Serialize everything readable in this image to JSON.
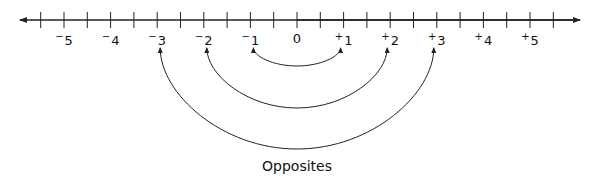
{
  "diagram": {
    "type": "number-line",
    "caption": "Opposites",
    "line": {
      "y": 20,
      "x_start": 20,
      "x_end": 580,
      "arrows": "both"
    },
    "zero_x": 297,
    "unit_px": 46.6,
    "ticks": [
      -5.5,
      -5,
      -4.5,
      -4,
      -3.5,
      -3,
      -2.5,
      -2,
      -1.5,
      -1,
      -0.5,
      0,
      0.5,
      1,
      1.5,
      2,
      2.5,
      3,
      3.5,
      4,
      4.5,
      5,
      5.5
    ],
    "labels": [
      {
        "value": -5,
        "sign": "−",
        "num": "5"
      },
      {
        "value": -4,
        "sign": "−",
        "num": "4"
      },
      {
        "value": -3,
        "sign": "−",
        "num": "3"
      },
      {
        "value": -2,
        "sign": "−",
        "num": "2"
      },
      {
        "value": -1,
        "sign": "−",
        "num": "1"
      },
      {
        "value": 0,
        "sign": "",
        "num": "0"
      },
      {
        "value": 1,
        "sign": "+",
        "num": "1"
      },
      {
        "value": 2,
        "sign": "+",
        "num": "2"
      },
      {
        "value": 3,
        "sign": "+",
        "num": "3"
      },
      {
        "value": 4,
        "sign": "+",
        "num": "4"
      },
      {
        "value": 5,
        "sign": "+",
        "num": "5"
      }
    ],
    "arcs": [
      {
        "from": -1,
        "to": 1,
        "bottom_y": 66
      },
      {
        "from": -2,
        "to": 2,
        "bottom_y": 108
      },
      {
        "from": -3,
        "to": 3,
        "bottom_y": 149
      }
    ],
    "stroke_color": "#222222"
  }
}
